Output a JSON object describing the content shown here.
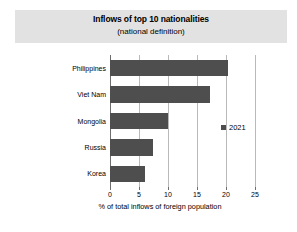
{
  "title_band": {
    "title": "Inflows of top 10 nationalities",
    "subtitle": "(national definition)",
    "background_color": "#e2e2e2"
  },
  "legend": {
    "entries": [
      {
        "label": "2021",
        "color": "#4e4e4e",
        "marker": "square-marker"
      }
    ]
  },
  "axis": {
    "x_title": "% of total inflows of foreign population",
    "x_ticks": [
      "0",
      "5",
      "10",
      "15",
      "20",
      "25"
    ]
  },
  "chart_data": {
    "type": "bar",
    "orientation": "horizontal",
    "title": "Inflows of top 10 nationalities",
    "subtitle": "(national definition)",
    "xlabel": "% of total inflows of foreign population",
    "ylabel": "",
    "xlim": [
      0,
      25
    ],
    "xticks": [
      0,
      5,
      10,
      15,
      20,
      25
    ],
    "grid": true,
    "legend_position": "inside-right",
    "bar_color": "#4e4e4e",
    "categories": [
      "Philippines",
      "Viet Nam",
      "Mongolia",
      "Russia",
      "Korea"
    ],
    "series": [
      {
        "name": "2021",
        "color": "#4e4e4e",
        "values": [
          20.4,
          17.2,
          10.0,
          7.4,
          6.0
        ]
      }
    ]
  }
}
